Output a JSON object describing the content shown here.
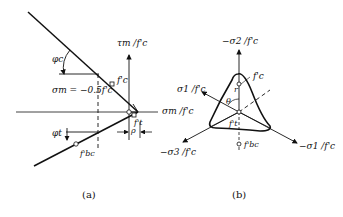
{
  "figure_a": {
    "caption": "(a)",
    "tau_axis_label": "τm /f'c",
    "sigma_axis_label": "σm /f'c",
    "phi_c_label": "φc",
    "phi_t_label": "φt",
    "sigma_m_eq": "σm = −0.5f'c",
    "fc_label": "f'c",
    "ft_label": "f't",
    "fbc_label": "f'bc",
    "rho_label": "ρ"
  },
  "figure_b": {
    "caption": "(b)",
    "neg_sigma2_label": "−σ2 /f'c",
    "sigma1_label": "σ1 /f'c",
    "neg_sigma3_label": "−σ3 /f'c",
    "neg_sigma1_label": "−σ1 /f'c",
    "fc_label": "f'c",
    "ft_label": "f't",
    "fbc_label": "f'bc",
    "r_label": "r",
    "theta_label": "θ"
  },
  "colors": {
    "ink": "#111111",
    "background": "#ffffff"
  }
}
